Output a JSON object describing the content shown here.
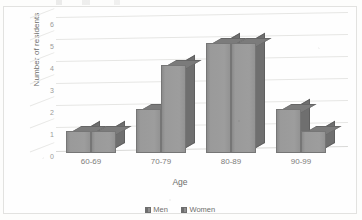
{
  "chart_data": {
    "type": "bar",
    "title": "",
    "xlabel": "Age",
    "ylabel": "Number of residents",
    "categories": [
      "60-69",
      "70-79",
      "80-89",
      "90-99"
    ],
    "series": [
      {
        "name": "Men",
        "values": [
          1,
          2,
          5,
          2
        ]
      },
      {
        "name": "Women",
        "values": [
          1,
          4,
          5,
          1
        ]
      }
    ],
    "yticks": [
      6,
      5,
      4,
      3,
      2,
      1,
      0
    ],
    "ylim": [
      0,
      6
    ],
    "grid": true,
    "legend_position": "bottom",
    "style": "3d-clustered-column",
    "colors": {
      "men": "#9a9a9a",
      "women": "#9a9a9a",
      "gridline": "#e6e6e4"
    }
  },
  "legend": {
    "items": [
      {
        "label": "Men"
      },
      {
        "label": "Women"
      }
    ]
  }
}
